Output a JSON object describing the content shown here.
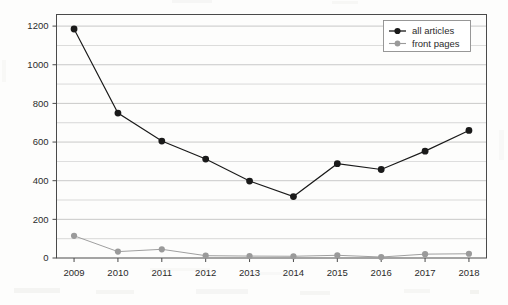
{
  "chart_data": {
    "type": "line",
    "title": "",
    "subtitle": "",
    "xlabel": "",
    "ylabel": "",
    "categories": [
      "2009",
      "2010",
      "2011",
      "2012",
      "2013",
      "2014",
      "2015",
      "2016",
      "2017",
      "2018"
    ],
    "x": [
      2009,
      2010,
      2011,
      2012,
      2013,
      2014,
      2015,
      2016,
      2017,
      2018
    ],
    "xlim": [
      2008.6,
      2018.4
    ],
    "ylim": [
      0,
      1260
    ],
    "y_ticks": [
      0,
      200,
      400,
      600,
      800,
      1000,
      1200
    ],
    "y_tick_labels": [
      "0",
      "200",
      "400",
      "600",
      "800",
      "1000",
      "1200"
    ],
    "y_minor_gridlines": [
      100,
      300,
      500,
      700,
      900,
      1100
    ],
    "grid": true,
    "grid_color": "#b9b9b9",
    "legend_position": "top-right",
    "series": [
      {
        "name": "all articles",
        "color": "#1a1a1a",
        "marker": "circle",
        "values": [
          1185,
          750,
          605,
          512,
          398,
          318,
          488,
          458,
          553,
          660
        ]
      },
      {
        "name": "front pages",
        "color": "#9a9a9a",
        "marker": "circle",
        "values": [
          115,
          33,
          45,
          12,
          10,
          9,
          14,
          5,
          20,
          22
        ]
      }
    ],
    "annotations": []
  },
  "legend": {
    "entries": [
      {
        "label": "all articles"
      },
      {
        "label": "front pages"
      }
    ]
  },
  "colors": {
    "series_all_articles": "#1a1a1a",
    "series_front_pages": "#9a9a9a",
    "axis": "#4a4a4a",
    "grid": "#b9b9b9",
    "background": "#fdfdfc",
    "text": "#2b2b2b"
  }
}
